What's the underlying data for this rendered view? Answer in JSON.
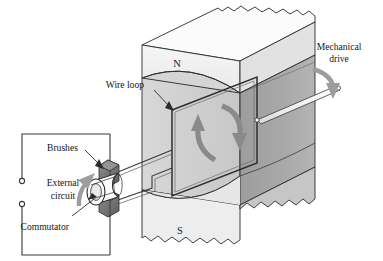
{
  "figure": {
    "background_color": "#ffffff",
    "width": 383,
    "height": 261
  },
  "magnet": {
    "north_pole_label": "N",
    "south_pole_label": "S",
    "face_light_color": "#d2d2d2",
    "face_dark_color": "#a9a9a9",
    "face_top_color": "#f2f2f2",
    "edge_color": "#2b2b2b"
  },
  "labels": {
    "wire_loop": "Wire loop",
    "mechanical_drive_line1": "Mechanical",
    "mechanical_drive_line2": "drive",
    "brushes": "Brushes",
    "external_circuit_line1": "External",
    "external_circuit_line2": "circuit",
    "commutator": "Commutator"
  },
  "arrows": {
    "rotation_color": "#8a8a8a",
    "drive_color": "#9a9a9a",
    "current_color": "#9a9a9a",
    "loop_flow_color": "#909090"
  },
  "circuit": {
    "wire_color": "#3a3a3a",
    "terminal_count": 2,
    "terminal_fill": "#ffffff"
  },
  "commutator_assembly": {
    "brush_fill": "#6e6e6e",
    "brush_top_fill": "#8d8d8d",
    "ring_fill": "#fdfdfd",
    "ring_stroke": "#2b2b2b",
    "shaft_fill": "#f7f7f7"
  }
}
